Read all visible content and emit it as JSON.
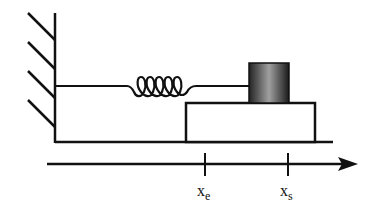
{
  "diagram": {
    "type": "spring-mass system on moving block",
    "colors": {
      "stroke": "#111111",
      "mass_dark": "#1a1a1a",
      "mass_light": "#9a9a9a",
      "background": "#ffffff"
    },
    "axis": {
      "labels": [
        {
          "main": "x",
          "sub": "e"
        },
        {
          "main": "x",
          "sub": "s"
        }
      ]
    }
  }
}
